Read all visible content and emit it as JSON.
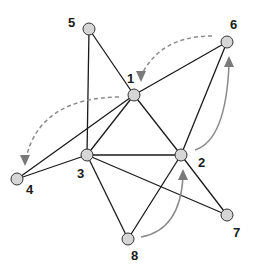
{
  "diagram": {
    "type": "graph",
    "nodes": [
      {
        "id": "1",
        "label": "1",
        "x": 134,
        "y": 95,
        "lx": 127,
        "ly": 83
      },
      {
        "id": "2",
        "label": "2",
        "x": 181,
        "y": 155,
        "lx": 198,
        "ly": 167
      },
      {
        "id": "3",
        "label": "3",
        "x": 87,
        "y": 155,
        "lx": 77,
        "ly": 178
      },
      {
        "id": "4",
        "label": "4",
        "x": 17,
        "y": 179,
        "lx": 26,
        "ly": 194
      },
      {
        "id": "5",
        "label": "5",
        "x": 89,
        "y": 29,
        "lx": 68,
        "ly": 27
      },
      {
        "id": "6",
        "label": "6",
        "x": 227,
        "y": 42,
        "lx": 230,
        "ly": 29
      },
      {
        "id": "7",
        "label": "7",
        "x": 227,
        "y": 215,
        "lx": 233,
        "ly": 237
      },
      {
        "id": "8",
        "label": "8",
        "x": 128,
        "y": 239,
        "lx": 131,
        "ly": 260
      }
    ],
    "edges": [
      [
        "5",
        "3"
      ],
      [
        "5",
        "1"
      ],
      [
        "1",
        "6"
      ],
      [
        "1",
        "4"
      ],
      [
        "1",
        "3"
      ],
      [
        "1",
        "2"
      ],
      [
        "6",
        "2"
      ],
      [
        "3",
        "4"
      ],
      [
        "3",
        "2"
      ],
      [
        "3",
        "7"
      ],
      [
        "3",
        "8"
      ],
      [
        "2",
        "8"
      ],
      [
        "2",
        "7"
      ]
    ],
    "arrows": [
      {
        "from": "6",
        "to": "1",
        "style": "dashed",
        "path": "M212,36 Q160,36 141,76",
        "tip": [
          141,
          82
        ],
        "dir": "down"
      },
      {
        "from": "1",
        "to": "4",
        "style": "dashed",
        "path": "M119,97 Q40,98 26,158",
        "tip": [
          25,
          166
        ],
        "dir": "down"
      },
      {
        "from": "2",
        "to": "6",
        "style": "solid",
        "path": "M195,150 Q226,140 229,64",
        "tip": [
          229,
          56
        ],
        "dir": "up"
      },
      {
        "from": "8",
        "to": "2",
        "style": "solid",
        "path": "M141,237 Q180,230 183,177",
        "tip": [
          183,
          169
        ],
        "dir": "up"
      }
    ]
  }
}
